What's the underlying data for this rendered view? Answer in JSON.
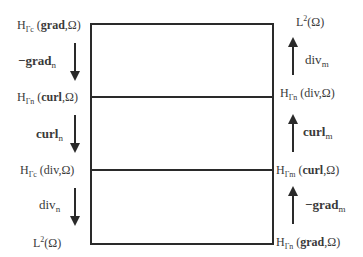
{
  "left_column": {
    "spaces": [
      {
        "prefix": "H",
        "sub": "Γc",
        "arg_bold": "grad",
        "arg_rest": ",Ω"
      },
      {
        "prefix": "H",
        "sub": "Γn",
        "arg_bold": "curl",
        "arg_rest": ",Ω"
      },
      {
        "prefix": "H",
        "sub": "Γc",
        "arg_bold": "",
        "arg_rest": "div,Ω"
      },
      {
        "prefix": "L",
        "sup": "2",
        "arg_rest": "Ω"
      }
    ],
    "operators": [
      {
        "main": "−grad",
        "sub": "n",
        "bold": true,
        "direction": "down"
      },
      {
        "main": "curl",
        "sub": "n",
        "bold": true,
        "direction": "down"
      },
      {
        "main": "div",
        "sub": "n",
        "bold": false,
        "direction": "down"
      }
    ]
  },
  "right_column": {
    "spaces": [
      {
        "prefix": "L",
        "sup": "2",
        "arg_rest": "Ω"
      },
      {
        "prefix": "H",
        "sub": "Γn",
        "arg_bold": "",
        "arg_rest": "div,Ω"
      },
      {
        "prefix": "H",
        "sub": "Γm",
        "arg_bold": "curl",
        "arg_rest": ",Ω"
      },
      {
        "prefix": "H",
        "sub": "Γn",
        "arg_bold": "grad",
        "arg_rest": ",Ω"
      }
    ],
    "operators": [
      {
        "main": "div",
        "sub": "m",
        "bold": false,
        "direction": "up"
      },
      {
        "main": "curl",
        "sub": "m",
        "bold": true,
        "direction": "up"
      },
      {
        "main": "−grad",
        "sub": "m",
        "bold": true,
        "direction": "up"
      }
    ]
  },
  "colors": {
    "line": "#2a2a2a",
    "text": "#3a3a3a",
    "background": "#ffffff"
  }
}
